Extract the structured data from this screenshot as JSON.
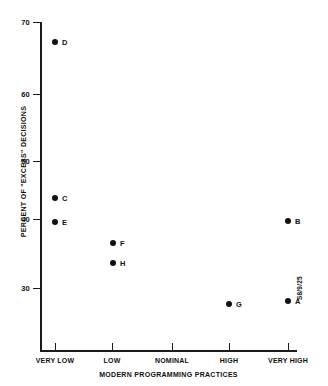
{
  "chart_data": {
    "type": "scatter",
    "title": "",
    "xlabel": "MODERN PROGRAMMING PRACTICES",
    "ylabel": "PERCENT OF \"EXCESS\" DECISIONS",
    "figure_id": "S8/9/25",
    "grid": false,
    "legend": "none",
    "x_categories": [
      "VERY LOW",
      "LOW",
      "NOMINAL",
      "HIGH",
      "VERY HIGH"
    ],
    "x_category_values": [
      1,
      2,
      3,
      4,
      5
    ],
    "xlim": [
      0.75,
      5.3
    ],
    "y_ticks": [
      30,
      40,
      50,
      60,
      70
    ],
    "ylim": [
      25,
      70
    ],
    "point_color": "#111111",
    "points": [
      {
        "label": "D",
        "x_category": "VERY LOW",
        "x": 1,
        "y": 65.5
      },
      {
        "label": "C",
        "x_category": "VERY LOW",
        "x": 1,
        "y": 43.0
      },
      {
        "label": "E",
        "x_category": "VERY LOW",
        "x": 1,
        "y": 39.5
      },
      {
        "label": "F",
        "x_category": "LOW",
        "x": 2,
        "y": 36.5
      },
      {
        "label": "H",
        "x_category": "LOW",
        "x": 2,
        "y": 34.5
      },
      {
        "label": "G",
        "x_category": "HIGH",
        "x": 4,
        "y": 27.5
      },
      {
        "label": "A",
        "x_category": "VERY HIGH",
        "x": 5,
        "y": 27.8
      },
      {
        "label": "B",
        "x_category": "VERY HIGH",
        "x": 5,
        "y": 40.2
      }
    ]
  },
  "geometry": {
    "plot_left": 40,
    "plot_right": 297,
    "plot_top": 22,
    "plot_bottom": 352,
    "y_tick_px": {
      "70": 22,
      "60": 94,
      "50": 161,
      "40": 219,
      "30": 288
    },
    "x_tick_px": {
      "VERY LOW": 55,
      "LOW": 112,
      "NOMINAL": 172,
      "HIGH": 229,
      "VERY HIGH": 288
    },
    "point_px": {
      "D": [
        55,
        42
      ],
      "C": [
        55,
        198
      ],
      "E": [
        55,
        222
      ],
      "F": [
        113,
        243
      ],
      "H": [
        113,
        263
      ],
      "G": [
        229,
        304
      ],
      "A": [
        288,
        301
      ],
      "B": [
        288,
        221
      ]
    }
  }
}
